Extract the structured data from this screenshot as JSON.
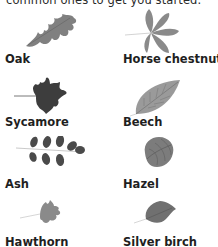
{
  "intro_text": "common ones to get you started.",
  "leaves": [
    {
      "name": "Oak",
      "icon": "oak-leaf-icon"
    },
    {
      "name": "Horse chestnut",
      "icon": "horse-chestnut-leaf-icon"
    },
    {
      "name": "Sycamore",
      "icon": "sycamore-leaf-icon"
    },
    {
      "name": "Beech",
      "icon": "beech-leaf-icon"
    },
    {
      "name": "Ash",
      "icon": "ash-leaf-icon"
    },
    {
      "name": "Hazel",
      "icon": "hazel-leaf-icon"
    },
    {
      "name": "Hawthorn",
      "icon": "hawthorn-leaf-icon"
    },
    {
      "name": "Silver birch",
      "icon": "silver-birch-leaf-icon"
    }
  ]
}
